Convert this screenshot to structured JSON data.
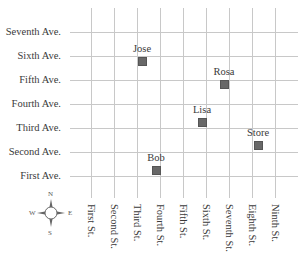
{
  "map": {
    "avenues": [
      {
        "label": "Seventh Ave.",
        "y": 32
      },
      {
        "label": "Sixth Ave.",
        "y": 56
      },
      {
        "label": "Fifth Ave.",
        "y": 80
      },
      {
        "label": "Fourth Ave.",
        "y": 104
      },
      {
        "label": "Third Ave.",
        "y": 128
      },
      {
        "label": "Second Ave.",
        "y": 152
      },
      {
        "label": "First Ave.",
        "y": 176
      }
    ],
    "streets": [
      {
        "label": "First St.",
        "x": 91
      },
      {
        "label": "Second St.",
        "x": 114
      },
      {
        "label": "Third St.",
        "x": 137
      },
      {
        "label": "Fourth St.",
        "x": 160
      },
      {
        "label": "Fifth St.",
        "x": 183
      },
      {
        "label": "Sixth St.",
        "x": 206
      },
      {
        "label": "Seventh St.",
        "x": 229
      },
      {
        "label": "Eighth St.",
        "x": 252
      },
      {
        "label": "Ninth St.",
        "x": 275
      }
    ],
    "locations": [
      {
        "label": "Jose",
        "x": 142,
        "y": 61
      },
      {
        "label": "Rosa",
        "x": 224,
        "y": 84
      },
      {
        "label": "Lisa",
        "x": 202,
        "y": 122
      },
      {
        "label": "Store",
        "x": 258,
        "y": 145
      },
      {
        "label": "Bob",
        "x": 156,
        "y": 170
      }
    ],
    "compass": {
      "north": "N",
      "south": "S",
      "east": "E",
      "west": "W",
      "icon": "compass-rose-icon"
    },
    "colors": {
      "grid": "#c8c8c8",
      "marker": "#686868",
      "text": "#3a3a3a"
    }
  }
}
